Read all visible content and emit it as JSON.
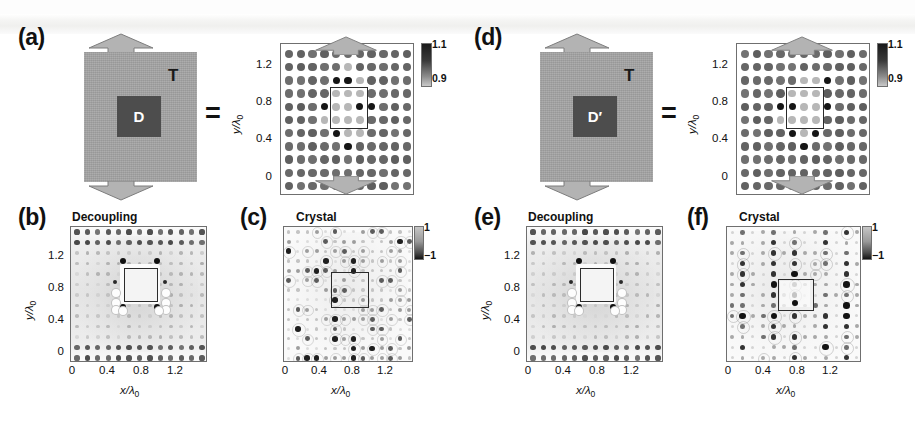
{
  "figure": {
    "kind": "multi-panel scientific figure",
    "panels": [
      "a",
      "b",
      "c",
      "d",
      "e",
      "f"
    ]
  },
  "labels": {
    "a": "(a)",
    "b": "(b)",
    "c": "(c)",
    "d": "(d)",
    "e": "(e)",
    "f": "(f)"
  },
  "titles": {
    "b": "Decoupling",
    "c": "Crystal",
    "e": "Decoupling",
    "f": "Crystal"
  },
  "schematic_a": {
    "outer_label": "T",
    "inner_label": "D",
    "equals": "=",
    "outer_color": "#a6a6a6",
    "inner_color": "#4d4d4d",
    "arrow_color": "#b3b3b3"
  },
  "schematic_d": {
    "outer_label": "T",
    "inner_label": "D′",
    "equals": "=",
    "outer_color": "#a6a6a6",
    "inner_color": "#4d4d4d",
    "arrow_color": "#b3b3b3"
  },
  "axes": {
    "xlabel": "x/λ",
    "xlabel_sub": "0",
    "ylabel": "y/λ",
    "ylabel_sub": "0",
    "xticks": [
      "0",
      "0.4",
      "0.8",
      "1.2"
    ],
    "yticks": [
      "0",
      "0.4",
      "0.8",
      "1.2"
    ]
  },
  "colorbars": {
    "lattice": {
      "max": "1.1",
      "min": "0.9"
    },
    "crystal": {
      "max": "1",
      "min": "−1"
    }
  },
  "chart_data": [
    {
      "id": "a-right",
      "type": "heatmap",
      "title": "",
      "xlabel": "x/λ0",
      "ylabel": "y/λ0",
      "xlim": [
        -0.18,
        1.46
      ],
      "ylim": [
        -0.18,
        1.46
      ],
      "xticks": [
        0,
        0.4,
        0.8,
        1.2
      ],
      "yticks": [
        0,
        0.4,
        0.8,
        1.2
      ],
      "grid": false,
      "colorbar": {
        "label": "",
        "vmin": 0.9,
        "vmax": 1.1,
        "ticks": [
          0.9,
          1.1
        ]
      },
      "description": "11 x 11 square lattice of dielectric rods; uniform mid-gray rods outside, central 3x3 region contains rods of modified index marked by a solid box",
      "lattice": {
        "nx": 11,
        "ny": 11,
        "spacing": 0.133,
        "x0": 0.0,
        "y0": 0.0
      },
      "highlight_box": {
        "x": 0.47,
        "y": 0.47,
        "w": 0.33,
        "h": 0.33
      },
      "values_note": "rod index values between 0.9 and 1.1; dark rods ~1.1, light rods ~0.9",
      "dark_rod_cells": [
        [
          4,
          8
        ],
        [
          5,
          8
        ],
        [
          3,
          6
        ],
        [
          6,
          6
        ],
        [
          7,
          6
        ],
        [
          4,
          4
        ],
        [
          5,
          3
        ]
      ]
    },
    {
      "id": "b",
      "type": "heatmap",
      "title": "Decoupling",
      "xlabel": "x/λ0",
      "ylabel": "y/λ0",
      "xlim": [
        -0.18,
        1.46
      ],
      "ylim": [
        -0.18,
        1.46
      ],
      "xticks": [
        0,
        0.4,
        0.8,
        1.2
      ],
      "yticks": [
        0,
        0.4,
        0.8,
        1.2
      ],
      "grid": false,
      "colorbar": null,
      "description": "Field magnitude map for the decoupling (cloaked) configuration: near-uniform light background, strong dark lobes only along top and bottom rows, four dark spots at the corners of the central white square region",
      "highlight_box": {
        "x": 0.5,
        "y": 0.47,
        "w": 0.3,
        "h": 0.3
      }
    },
    {
      "id": "c",
      "type": "heatmap",
      "title": "Crystal",
      "xlabel": "x/λ0",
      "ylabel": "y/λ0",
      "xlim": [
        -0.18,
        1.46
      ],
      "ylim": [
        -0.18,
        1.46
      ],
      "xticks": [
        0,
        0.4,
        0.8,
        1.2
      ],
      "yticks": [
        0,
        0.4,
        0.8,
        1.2
      ],
      "grid": false,
      "colorbar": {
        "label": "",
        "vmin": -1,
        "vmax": 1,
        "ticks": [
          -1,
          1
        ]
      },
      "description": "Field map for the full crystal: diffuse speckled pattern of weak positive and negative lobes across the whole cell, slightly stronger near the left and right edges",
      "highlight_box": {
        "x": 0.47,
        "y": 0.47,
        "w": 0.33,
        "h": 0.33
      }
    },
    {
      "id": "d-right",
      "type": "heatmap",
      "title": "",
      "xlabel": "x/λ0",
      "ylabel": "y/λ0",
      "xlim": [
        -0.18,
        1.46
      ],
      "ylim": [
        -0.18,
        1.46
      ],
      "xticks": [
        0,
        0.4,
        0.8,
        1.2
      ],
      "yticks": [
        0,
        0.4,
        0.8,
        1.2
      ],
      "grid": false,
      "colorbar": {
        "label": "",
        "vmin": 0.9,
        "vmax": 1.1,
        "ticks": [
          0.9,
          1.1
        ]
      },
      "description": "Same 11 x 11 rod lattice as panel (a) but with the alternative defect D-prime; modified rods inside the central marked box differ in position",
      "lattice": {
        "nx": 11,
        "ny": 11,
        "spacing": 0.133,
        "x0": 0.0,
        "y0": 0.0
      },
      "highlight_box": {
        "x": 0.47,
        "y": 0.47,
        "w": 0.33,
        "h": 0.33
      },
      "dark_rod_cells": [
        [
          7,
          8
        ],
        [
          3,
          6
        ],
        [
          4,
          6
        ],
        [
          7,
          6
        ],
        [
          4,
          4
        ],
        [
          6,
          4
        ],
        [
          5,
          3
        ]
      ]
    },
    {
      "id": "e",
      "type": "heatmap",
      "title": "Decoupling",
      "xlabel": "x/λ0",
      "ylabel": "y/λ0",
      "xlim": [
        -0.18,
        1.46
      ],
      "ylim": [
        -0.18,
        1.46
      ],
      "xticks": [
        0,
        0.4,
        0.8,
        1.2
      ],
      "yticks": [
        0,
        0.4,
        0.8,
        1.2
      ],
      "grid": false,
      "colorbar": null,
      "description": "Decoupling field map for the D-prime defect; nearly identical to panel (b): uniform light field with dark rows top and bottom and four dark corner spots bounding the central white square",
      "highlight_box": {
        "x": 0.5,
        "y": 0.47,
        "w": 0.3,
        "h": 0.3
      }
    },
    {
      "id": "f",
      "type": "heatmap",
      "title": "Crystal",
      "xlabel": "x/λ0",
      "ylabel": "y/λ0",
      "xlim": [
        -0.18,
        1.46
      ],
      "ylim": [
        -0.18,
        1.46
      ],
      "xticks": [
        0,
        0.4,
        0.8,
        1.2
      ],
      "yticks": [
        0,
        0.4,
        0.8,
        1.2
      ],
      "grid": false,
      "colorbar": {
        "label": "",
        "vmin": -1,
        "vmax": 1,
        "ticks": [
          -1,
          1
        ]
      },
      "description": "Crystal field map for the D-prime defect: strongly structured vertical columns of alternating dark lobes, most intense in the left half and near the central box",
      "highlight_box": {
        "x": 0.47,
        "y": 0.47,
        "w": 0.33,
        "h": 0.33
      }
    }
  ]
}
